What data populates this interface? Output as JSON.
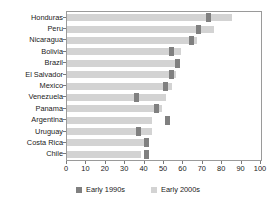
{
  "chart_data": {
    "type": "bar",
    "orientation": "horizontal",
    "title": "",
    "xlabel": "",
    "ylabel": "",
    "xlim": [
      0,
      100
    ],
    "xticks": [
      0,
      10,
      20,
      30,
      40,
      50,
      60,
      70,
      80,
      90,
      100
    ],
    "grid": false,
    "legend_position": "bottom",
    "categories": [
      "Honduras",
      "Peru",
      "Nicaragua",
      "Bolivia",
      "Brazil",
      "El Salvador",
      "Mexico",
      "Venezuela",
      "Panama",
      "Argentina",
      "Uruguay",
      "Costa Rica",
      "Chile"
    ],
    "series": [
      {
        "name": "Early 1990s",
        "color": "#808080",
        "values": [
          73,
          68,
          64,
          54,
          57,
          54,
          51,
          36,
          46,
          52,
          37,
          41,
          41
        ]
      },
      {
        "name": "Early 2000s",
        "color": "#d3d3d3",
        "values": [
          85,
          76,
          67,
          59,
          58,
          56,
          54,
          51,
          49,
          44,
          44,
          42,
          38
        ]
      }
    ]
  },
  "axis": {
    "x_tick_labels": [
      "0",
      "10",
      "20",
      "30",
      "40",
      "50",
      "60",
      "70",
      "80",
      "90",
      "100"
    ]
  },
  "legend": {
    "items": [
      {
        "label": "Early 1990s",
        "color": "#808080"
      },
      {
        "label": "Early 2000s",
        "color": "#d3d3d3"
      }
    ]
  }
}
